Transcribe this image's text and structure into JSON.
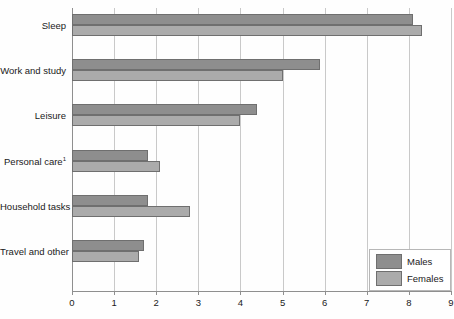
{
  "chart_data": {
    "type": "bar",
    "orientation": "horizontal",
    "title": "",
    "xlabel": "",
    "ylabel": "",
    "xlim": [
      0,
      9
    ],
    "xticks": [
      "0",
      "1",
      "2",
      "3",
      "4",
      "5",
      "6",
      "7",
      "8",
      "9"
    ],
    "grid": true,
    "legend_position": "bottom-right",
    "categories": [
      "Sleep",
      "Work and study",
      "Leisure",
      "Personal care",
      "Household tasks",
      "Travel and other"
    ],
    "category_footnotes": {
      "Personal care": "1"
    },
    "series": [
      {
        "name": "Males",
        "color": "#8e8e8e",
        "values": [
          8.1,
          5.9,
          4.4,
          1.8,
          1.8,
          1.7
        ]
      },
      {
        "name": "Females",
        "color": "#ababab",
        "values": [
          8.3,
          5.0,
          4.0,
          2.1,
          2.8,
          1.6
        ]
      }
    ]
  },
  "legend": {
    "items": [
      {
        "label": "Males",
        "swatch": "males"
      },
      {
        "label": "Females",
        "swatch": "females"
      }
    ]
  },
  "colors": {
    "males": "#8e8e8e",
    "females": "#ababab",
    "bar_outline": "#6f6f6f",
    "gridline": "#c9c9c9",
    "axis": "#8f8f8f",
    "background": "#ffffff",
    "text": "#1a1a1a"
  }
}
